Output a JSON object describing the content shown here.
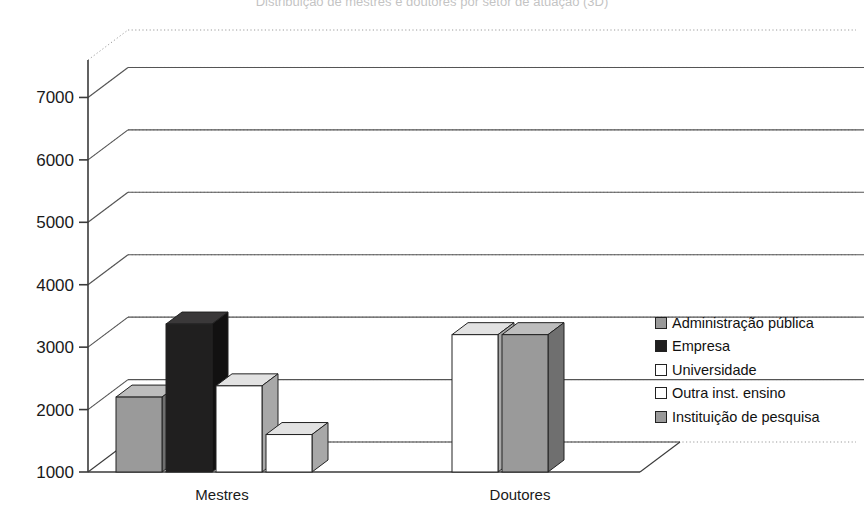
{
  "chart_data": {
    "type": "bar",
    "title": "Distribuição de mestres e doutores por setor de atuação (3D)",
    "xlabel": "",
    "ylabel": "",
    "categories": [
      "Mestres",
      "Doutores"
    ],
    "ylim": [
      1000,
      7600
    ],
    "yticks": [
      1000,
      2000,
      3000,
      4000,
      5000,
      6000,
      7000
    ],
    "ytick_labels": [
      "1000",
      "2000",
      "3000",
      "4000",
      "5000",
      "6000",
      "7000"
    ],
    "grid": true,
    "legend_position": "right",
    "series": [
      {
        "name": "Administração pública",
        "color": "#9a9a9a",
        "values": [
          2200,
          null
        ]
      },
      {
        "name": "Empresa",
        "color": "#201f1f",
        "values": [
          3370,
          null
        ]
      },
      {
        "name": "Universidade",
        "color": "#ffffff",
        "values": [
          2380,
          3200
        ]
      },
      {
        "name": "Outra inst. ensino",
        "color": "#ffffff",
        "values": [
          1600,
          null
        ]
      },
      {
        "name": "Instituição de pesquisa",
        "color": "#9a9a9a",
        "values": [
          null,
          3200
        ]
      }
    ],
    "bars": [
      {
        "group": "Mestres",
        "series": "Administração pública",
        "value": 2200
      },
      {
        "group": "Mestres",
        "series": "Empresa",
        "value": 3370
      },
      {
        "group": "Mestres",
        "series": "Universidade",
        "value": 2380
      },
      {
        "group": "Mestres",
        "series": "Outra inst. ensino",
        "value": 1600
      },
      {
        "group": "Doutores",
        "series": "Universidade",
        "value": 3200
      },
      {
        "group": "Doutores",
        "series": "Instituição de pesquisa",
        "value": 3200
      }
    ]
  },
  "axis": {
    "y_labels": [
      "7000",
      "6000",
      "5000",
      "4000",
      "3000",
      "2000",
      "1000"
    ],
    "x_labels": [
      "Mestres",
      "Doutores"
    ]
  },
  "legend": {
    "items": [
      {
        "label": "Administração pública",
        "swatch": "#9a9a9a"
      },
      {
        "label": "Empresa",
        "swatch": "#201f1f"
      },
      {
        "label": "Universidade",
        "swatch": "#ffffff"
      },
      {
        "label": "Outra inst. ensino",
        "swatch": "#ffffff"
      },
      {
        "label": "Instituição de pesquisa",
        "swatch": "#9a9a9a"
      }
    ]
  },
  "colors": {
    "gray_front": "#9a9a9a",
    "gray_top": "#bdbdbd",
    "gray_side": "#6f6f6f",
    "black_front": "#201f1f",
    "black_top": "#3a3839",
    "black_side": "#121111",
    "white_front": "#ffffff",
    "white_top": "#e2e2e2",
    "white_side": "#a8a8a8",
    "axis": "#3a3a3a",
    "grid_solid": "#555555",
    "grid_dotted": "#9b9b9b"
  }
}
